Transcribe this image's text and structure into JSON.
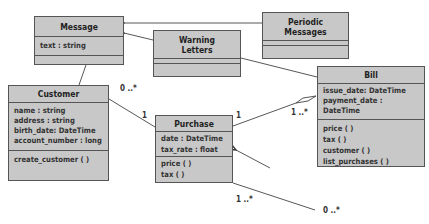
{
  "diagram": {
    "type": "UML class diagram",
    "classes": [
      {
        "id": "message",
        "name": "Message",
        "attributes": [
          "text : string"
        ],
        "operations": []
      },
      {
        "id": "periodic",
        "name": "Periodic Messages",
        "name_lines": [
          "Periodic",
          "Messages"
        ],
        "attributes": [],
        "operations": []
      },
      {
        "id": "warning",
        "name": "Warning Letters",
        "name_lines": [
          "Warning",
          "Letters"
        ],
        "attributes": [],
        "operations": []
      },
      {
        "id": "customer",
        "name": "Customer",
        "attributes": [
          "name : string",
          "address : string",
          "birth_date: DateTime",
          "account_number : long"
        ],
        "operations": [
          "create_customer ( )"
        ]
      },
      {
        "id": "purchase",
        "name": "Purchase",
        "attributes": [
          "date : DateTime",
          "tax_rate : float"
        ],
        "operations": [
          "price ( )",
          "tax ( )"
        ]
      },
      {
        "id": "bill",
        "name": "Bill",
        "attributes": [
          "issue_date: DateTime",
          "payment_date : DateTime"
        ],
        "operations": [
          "price ( )",
          "tax ( )",
          "customer ( )",
          "list_purchases ( )"
        ]
      }
    ],
    "relations": [
      {
        "from": "periodic",
        "to": "message",
        "kind": "generalization"
      },
      {
        "from": "warning",
        "to": "message",
        "kind": "generalization"
      },
      {
        "from": "warning",
        "to": "bill",
        "kind": "association"
      },
      {
        "from": "message",
        "to": "customer",
        "kind": "association"
      },
      {
        "from": "customer",
        "to": "purchase",
        "kind": "association",
        "from_mult": "0 ..*",
        "to_mult": "1"
      },
      {
        "from": "purchase",
        "to": "bill",
        "kind": "aggregation",
        "from_mult": "1",
        "to_mult": "1 ..*"
      },
      {
        "from": "external",
        "to": "purchase",
        "kind": "navigable-association"
      },
      {
        "from": "purchase",
        "to": "external",
        "kind": "association",
        "from_mult": "1 ..*",
        "to_mult": "0 ..*"
      }
    ],
    "multiplicity_labels": {
      "customer_purchase_customer_end": "0 ..*",
      "customer_purchase_purchase_end": "1",
      "purchase_bill_purchase_end": "1",
      "purchase_bill_bill_end": "1 ..*",
      "purchase_bottom_near": "1 ..*",
      "purchase_bottom_far": "0 ..*"
    },
    "colors": {
      "box_fill": "#c8c8c8",
      "border": "#555555",
      "line": "#444444",
      "background": "#ffffff"
    }
  }
}
